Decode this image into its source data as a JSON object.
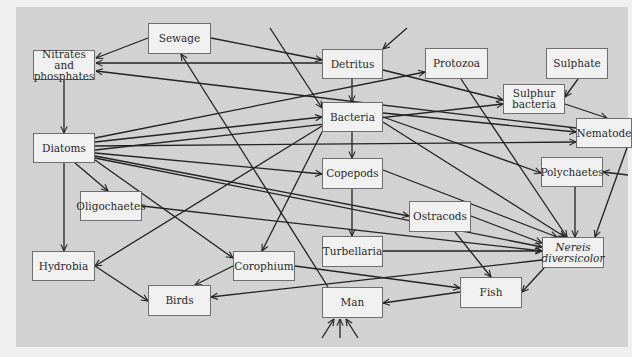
{
  "diagram": {
    "type": "food-web",
    "nodes": [
      {
        "id": "sewage",
        "label": "Sewage"
      },
      {
        "id": "nitrates",
        "label": "Nitrates and\nphosphates"
      },
      {
        "id": "detritus",
        "label": "Detritus"
      },
      {
        "id": "protozoa",
        "label": "Protozoa"
      },
      {
        "id": "sulphate",
        "label": "Sulphate"
      },
      {
        "id": "sulphur_bacteria",
        "label": "Sulphur\nbacteria"
      },
      {
        "id": "diatoms",
        "label": "Diatoms"
      },
      {
        "id": "bacteria",
        "label": "Bacteria"
      },
      {
        "id": "nematodes",
        "label": "Nematode"
      },
      {
        "id": "copepods",
        "label": "Copepods"
      },
      {
        "id": "polychaetes",
        "label": "Polychaetes"
      },
      {
        "id": "oligochaetes",
        "label": "Oligochaetes"
      },
      {
        "id": "ostracods",
        "label": "Ostracods"
      },
      {
        "id": "turbellaria",
        "label": "Turbellaria"
      },
      {
        "id": "nereis",
        "label": "Nereis\ndiversicolor",
        "italic": true
      },
      {
        "id": "hydrobia",
        "label": "Hydrobia"
      },
      {
        "id": "corophium",
        "label": "Corophium"
      },
      {
        "id": "birds",
        "label": "Birds"
      },
      {
        "id": "man",
        "label": "Man"
      },
      {
        "id": "fish",
        "label": "Fish"
      }
    ],
    "edges": [
      {
        "from": "sewage",
        "to": "nitrates"
      },
      {
        "from": "sewage",
        "to": "detritus"
      },
      {
        "from": "detritus",
        "to": "nitrates"
      },
      {
        "from": "nematodes",
        "to": "nitrates"
      },
      {
        "from": "nitrates",
        "to": "diatoms"
      },
      {
        "from": "external",
        "to": "detritus"
      },
      {
        "from": "detritus",
        "to": "bacteria"
      },
      {
        "from": "detritus",
        "to": "sulphur_bacteria"
      },
      {
        "from": "sulphate",
        "to": "sulphur_bacteria"
      },
      {
        "from": "sulphur_bacteria",
        "to": "nematodes"
      },
      {
        "from": "diatoms",
        "to": "protozoa"
      },
      {
        "from": "diatoms",
        "to": "bacteria"
      },
      {
        "from": "diatoms",
        "to": "nematodes"
      },
      {
        "from": "diatoms",
        "to": "sulphur_bacteria"
      },
      {
        "from": "diatoms",
        "to": "copepods"
      },
      {
        "from": "diatoms",
        "to": "ostracods"
      },
      {
        "from": "diatoms",
        "to": "oligochaetes"
      },
      {
        "from": "diatoms",
        "to": "hydrobia"
      },
      {
        "from": "diatoms",
        "to": "corophium"
      },
      {
        "from": "diatoms",
        "to": "nereis"
      },
      {
        "from": "bacteria",
        "to": "copepods"
      },
      {
        "from": "bacteria",
        "to": "nematodes"
      },
      {
        "from": "bacteria",
        "to": "polychaetes"
      },
      {
        "from": "bacteria",
        "to": "nereis"
      },
      {
        "from": "bacteria",
        "to": "hydrobia"
      },
      {
        "from": "bacteria",
        "to": "corophium"
      },
      {
        "from": "external",
        "to": "bacteria"
      },
      {
        "from": "protozoa",
        "to": "nereis"
      },
      {
        "from": "copepods",
        "to": "turbellaria"
      },
      {
        "from": "copepods",
        "to": "nereis"
      },
      {
        "from": "nematodes",
        "to": "nereis"
      },
      {
        "from": "external",
        "to": "polychaetes"
      },
      {
        "from": "polychaetes",
        "to": "nereis"
      },
      {
        "from": "oligochaetes",
        "to": "nereis"
      },
      {
        "from": "ostracods",
        "to": "nereis"
      },
      {
        "from": "ostracods",
        "to": "fish"
      },
      {
        "from": "turbellaria",
        "to": "nereis"
      },
      {
        "from": "nereis",
        "to": "birds"
      },
      {
        "from": "nereis",
        "to": "fish"
      },
      {
        "from": "hydrobia",
        "to": "birds"
      },
      {
        "from": "corophium",
        "to": "birds"
      },
      {
        "from": "corophium",
        "to": "fish"
      },
      {
        "from": "man",
        "to": "sewage"
      },
      {
        "from": "fish",
        "to": "man"
      },
      {
        "from": "external",
        "to": "man"
      }
    ]
  }
}
